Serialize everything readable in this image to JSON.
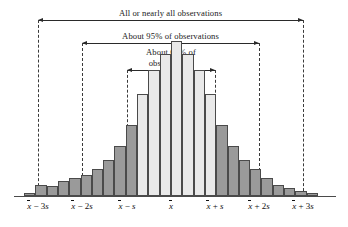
{
  "figure": {
    "width": 348,
    "height": 227
  },
  "annotations": [
    {
      "name": "all-observations",
      "label": "All or nearly all observations",
      "from_tick": "x-bar-minus-3s",
      "to_tick": "x-bar-plus-3s",
      "x_start": 38,
      "x_end": 303,
      "line_y": 20,
      "label_y": 8
    },
    {
      "name": "ninety-five-percent",
      "label": "About 95% of observations",
      "from_tick": "x-bar-minus-2s",
      "to_tick": "x-bar-plus-2s",
      "x_start": 82,
      "x_end": 259,
      "line_y": 43,
      "label_y": 31
    },
    {
      "name": "sixty-eight-percent",
      "label": "About 68% of\nobservations",
      "from_tick": "x-bar-minus-s",
      "to_tick": "x-bar-plus-s",
      "x_start": 127,
      "x_end": 215,
      "line_y": 70,
      "label_y": 47
    }
  ],
  "axis": {
    "baseline_y": 196,
    "x_start": 14,
    "x_end": 336,
    "ticks": [
      {
        "name": "x-bar-minus-3s",
        "text": "x̄ − 3s",
        "x": 38,
        "sign": "−",
        "multiplier": "3"
      },
      {
        "name": "x-bar-minus-2s",
        "text": "x̄ − 2s",
        "x": 82,
        "sign": "−",
        "multiplier": "2"
      },
      {
        "name": "x-bar-minus-s",
        "text": "x̄ − s",
        "x": 127,
        "sign": "−",
        "multiplier": ""
      },
      {
        "name": "x-bar",
        "text": "x̄",
        "x": 171,
        "sign": "",
        "multiplier": ""
      },
      {
        "name": "x-bar-plus-s",
        "text": "x̄ + s",
        "x": 215,
        "sign": "+",
        "multiplier": ""
      },
      {
        "name": "x-bar-plus-2s",
        "text": "x̄ + 2s",
        "x": 259,
        "sign": "+",
        "multiplier": "2"
      },
      {
        "name": "x-bar-plus-3s",
        "text": "x̄ + 3s",
        "x": 303,
        "sign": "+",
        "multiplier": "3"
      }
    ]
  },
  "dashed_lines": [
    {
      "name": "dashed-minus-3s",
      "x": 38,
      "y_top": 20,
      "y_bottom": 196
    },
    {
      "name": "dashed-minus-2s",
      "x": 82,
      "y_top": 43,
      "y_bottom": 196
    },
    {
      "name": "dashed-minus-s",
      "x": 127,
      "y_top": 70,
      "y_bottom": 196
    },
    {
      "name": "dashed-plus-s",
      "x": 215,
      "y_top": 70,
      "y_bottom": 196
    },
    {
      "name": "dashed-plus-2s",
      "x": 259,
      "y_top": 43,
      "y_bottom": 196
    },
    {
      "name": "dashed-plus-3s",
      "x": 303,
      "y_top": 20,
      "y_bottom": 196
    }
  ],
  "colors": {
    "bar_light": "#e9e9e9",
    "bar_dark": "#9a9a9a",
    "bar_border": "#4a4a4a",
    "axis": "#4a4a4a",
    "text": "#111111",
    "bracket": "#2a2a2a",
    "background": "#ffffff"
  },
  "chart_data": {
    "type": "bar",
    "title": "",
    "subtitle": "",
    "xlabel": "",
    "ylabel": "",
    "grid": false,
    "legend": "none",
    "xlim": [
      -3.4,
      3.4
    ],
    "ylim": [
      0,
      100
    ],
    "x_unit": "standard deviations from the mean (s)",
    "note": "Bell-shaped (approximately normal) histogram. Bars within x-bar +/- 1s are shaded light; bars outside are shaded dark gray.",
    "categories": [
      "-3.3s",
      "-3.0s",
      "-2.8s",
      "-2.5s",
      "-2.3s",
      "-2.0s",
      "-1.8s",
      "-1.5s",
      "-1.3s",
      "-1.0s",
      "-0.8s",
      "-0.5s",
      "-0.3s",
      "0.0s",
      "0.3s",
      "0.5s",
      "0.8s",
      "1.0s",
      "1.3s",
      "1.5s",
      "1.8s",
      "2.0s",
      "2.3s",
      "2.5s",
      "2.8s",
      "3.0s"
    ],
    "values": [
      2,
      7,
      6,
      9,
      11,
      13,
      17,
      22,
      31,
      44,
      63,
      78,
      88,
      96,
      88,
      78,
      63,
      44,
      31,
      22,
      17,
      11,
      7,
      5,
      3,
      2
    ],
    "shades": [
      "dark",
      "dark",
      "dark",
      "dark",
      "dark",
      "dark",
      "dark",
      "dark",
      "dark",
      "dark",
      "light",
      "light",
      "light",
      "light",
      "light",
      "light",
      "light",
      "dark",
      "dark",
      "dark",
      "dark",
      "dark",
      "dark",
      "dark",
      "dark",
      "dark"
    ]
  }
}
